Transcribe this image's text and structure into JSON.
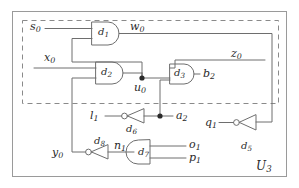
{
  "diagram": {
    "title": "U3",
    "block_label": {
      "base": "U",
      "sub": "3"
    },
    "type": "logic-circuit-schematic",
    "colors": {
      "wire": "#6e6e6e",
      "gate_stroke": "#6e6e6e",
      "text": "#2a2a2a",
      "dashed_boundary": "#8a8a8a",
      "outer_frame": "#9a9a9a",
      "background": "#ffffff",
      "junction": "#2a2a2a"
    },
    "boundaries": {
      "outer_frame_label": "outer-frame",
      "dashed_region_label": "dashed-subcircuit-boundary"
    },
    "signals": [
      {
        "id": "s0",
        "base": "s",
        "sub": "0",
        "role": "input",
        "x": 30,
        "y": 27
      },
      {
        "id": "w0",
        "base": "w",
        "sub": "0",
        "role": "internal",
        "x": 130,
        "y": 27
      },
      {
        "id": "z0",
        "base": "z",
        "sub": "0",
        "role": "internal",
        "x": 231,
        "y": 54
      },
      {
        "id": "x0",
        "base": "x",
        "sub": "0",
        "role": "input",
        "x": 44,
        "y": 57
      },
      {
        "id": "u0",
        "base": "u",
        "sub": "0",
        "role": "internal",
        "x": 134,
        "y": 89
      },
      {
        "id": "b2",
        "base": "b",
        "sub": "2",
        "role": "output",
        "x": 203,
        "y": 77
      },
      {
        "id": "l1",
        "base": "l",
        "sub": "1",
        "role": "input",
        "x": 92,
        "y": 113
      },
      {
        "id": "a2",
        "base": "a",
        "sub": "2",
        "role": "output",
        "x": 176,
        "y": 113
      },
      {
        "id": "q1",
        "base": "q",
        "sub": "1",
        "role": "input",
        "x": 207,
        "y": 126
      },
      {
        "id": "y0",
        "base": "y",
        "sub": "0",
        "role": "input",
        "x": 52,
        "y": 152
      },
      {
        "id": "n1",
        "base": "n",
        "sub": "1",
        "role": "internal",
        "x": 118,
        "y": 145
      },
      {
        "id": "o1",
        "base": "o",
        "sub": "1",
        "role": "output",
        "x": 190,
        "y": 144
      },
      {
        "id": "p1",
        "base": "p",
        "sub": "1",
        "role": "output",
        "x": 190,
        "y": 158
      }
    ],
    "gates": [
      {
        "id": "d1",
        "base": "d",
        "sub": "1",
        "kind": "and",
        "orientation": "right",
        "label_x": 100,
        "label_y": 33
      },
      {
        "id": "d2",
        "base": "d",
        "sub": "2",
        "kind": "and",
        "orientation": "right",
        "label_x": 106,
        "label_y": 73
      },
      {
        "id": "d3",
        "base": "d",
        "sub": "3",
        "kind": "and",
        "orientation": "right",
        "label_x": 179,
        "label_y": 75
      },
      {
        "id": "d5",
        "base": "d",
        "sub": "5",
        "kind": "inverter",
        "orientation": "left",
        "label_x": 243,
        "label_y": 146
      },
      {
        "id": "d6",
        "base": "d",
        "sub": "6",
        "kind": "inverter",
        "orientation": "left",
        "label_x": 128,
        "label_y": 130
      },
      {
        "id": "d7",
        "base": "d",
        "sub": "7",
        "kind": "and",
        "orientation": "left",
        "label_x": 151,
        "label_y": 157
      },
      {
        "id": "d8",
        "base": "d",
        "sub": "8",
        "kind": "inverter",
        "orientation": "left",
        "label_x": 96,
        "label_y": 142
      }
    ]
  }
}
